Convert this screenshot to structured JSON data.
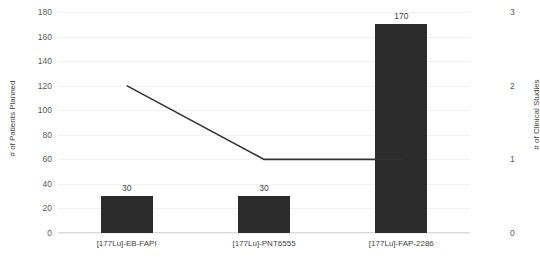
{
  "chart_data": {
    "type": "bar",
    "title": "",
    "subtitle": "",
    "categories": [
      "[177Lu]-EB-FAPI",
      "[177Lu]-PNT6555",
      "[177Lu]-FAP-2286"
    ],
    "series": [
      {
        "name": "# of Patients Planned",
        "type": "bar",
        "axis": "left",
        "color": "#2c2c2c",
        "values": [
          30,
          30,
          170
        ],
        "data_labels": [
          "30",
          "30",
          "170"
        ]
      },
      {
        "name": "# of Clinical Studies",
        "type": "line",
        "axis": "right",
        "color": "#333333",
        "values": [
          2,
          1,
          1
        ],
        "data_labels": []
      }
    ],
    "xlabel": "",
    "ylabel": "# of Patients Planned",
    "y2label": "# of Clinical Studies",
    "ylim": [
      0,
      180
    ],
    "y2lim": [
      0,
      3
    ],
    "yticks": [
      0,
      20,
      40,
      60,
      80,
      100,
      120,
      140,
      160,
      180
    ],
    "ytick_labels": [
      "0",
      "20",
      "40",
      "60",
      "80",
      "100",
      "120",
      "140",
      "160",
      "180"
    ],
    "y2ticks": [
      0,
      1,
      2,
      3
    ],
    "y2tick_labels": [
      "0",
      "1",
      "2",
      "3"
    ],
    "grid": true,
    "grid_axis": "y",
    "legend": false,
    "legend_position": "none"
  },
  "axes": {
    "left_title": "# of Patients Planned",
    "right_title": "# of Clinical Studies"
  }
}
